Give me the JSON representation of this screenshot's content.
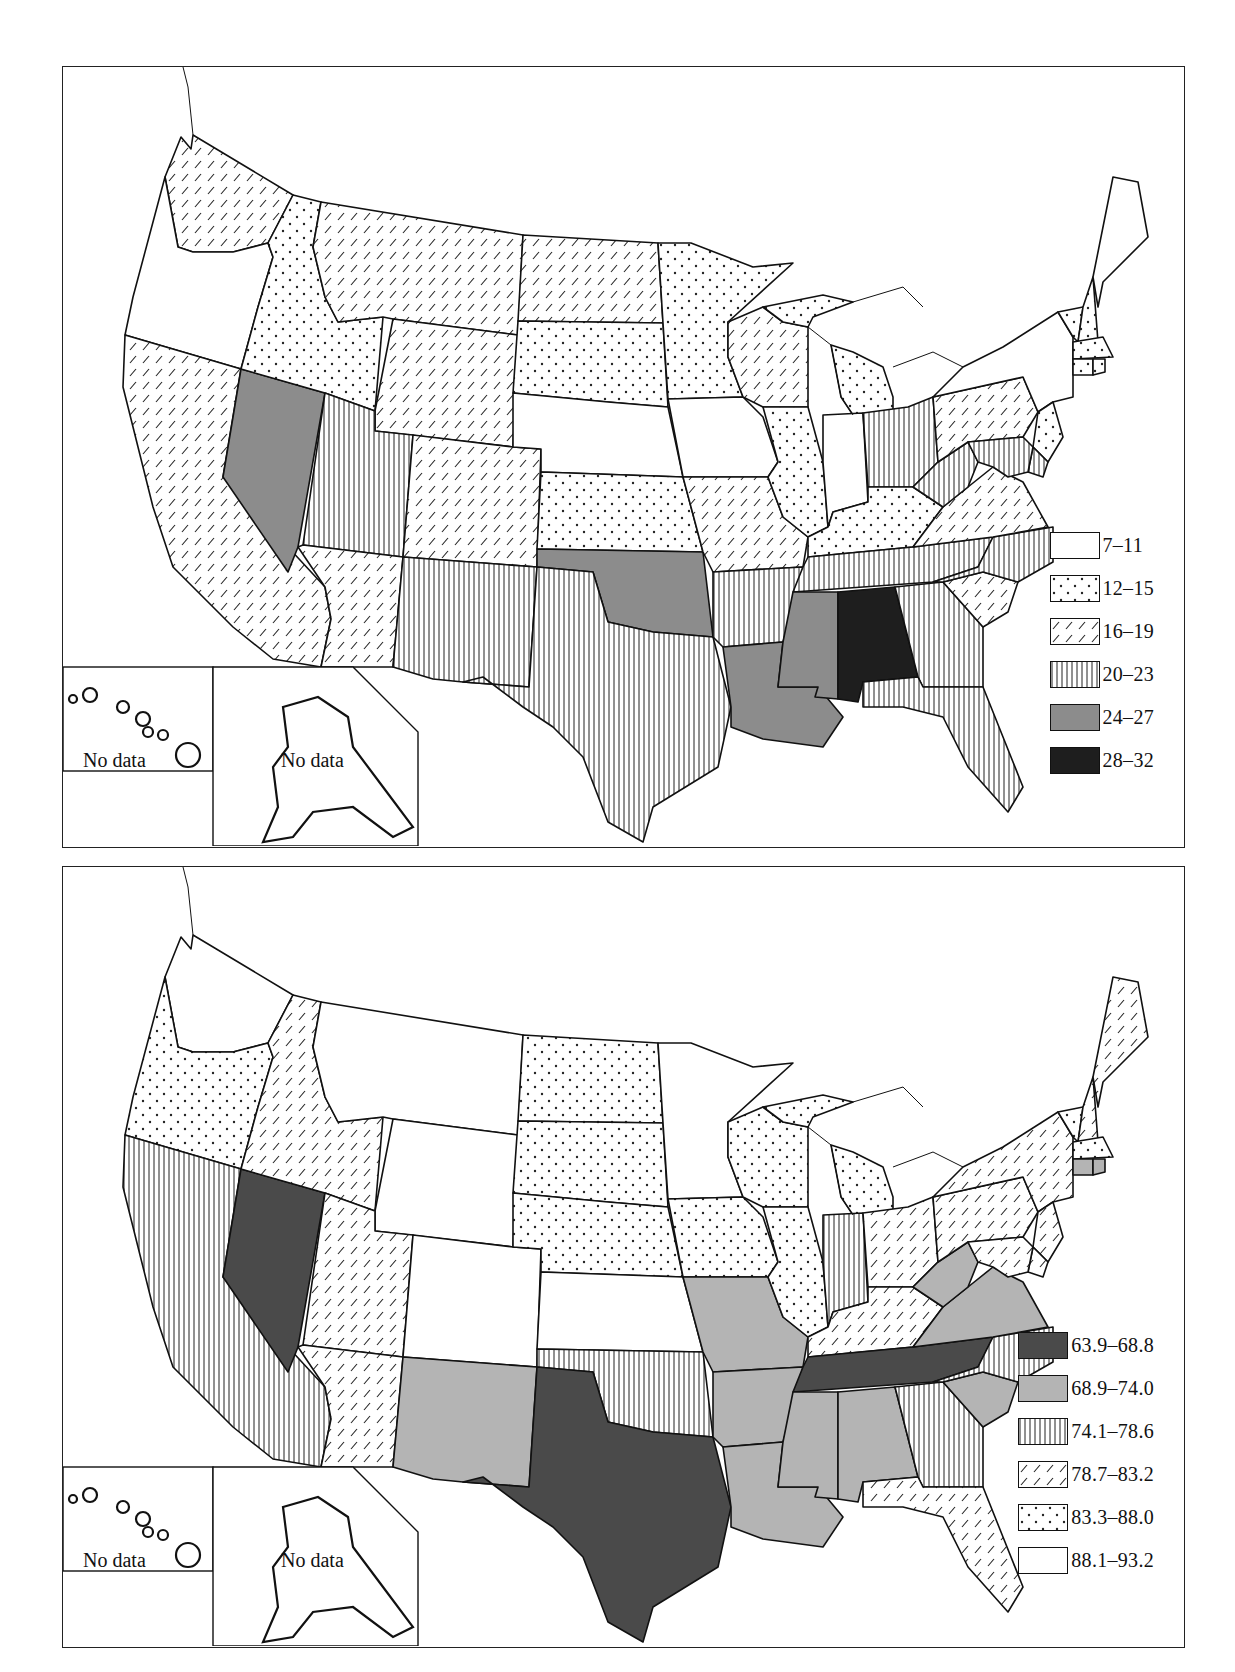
{
  "maps": [
    {
      "id": "map-1",
      "legend": [
        {
          "label": "7–11",
          "pattern": "white"
        },
        {
          "label": "12–15",
          "pattern": "dots"
        },
        {
          "label": "16–19",
          "pattern": "diag"
        },
        {
          "label": "20–23",
          "pattern": "vert"
        },
        {
          "label": "24–27",
          "pattern": "gray"
        },
        {
          "label": "28–32",
          "pattern": "black"
        }
      ],
      "insets": {
        "hawaii_label": "No data",
        "alaska_label": "No data"
      },
      "states": {
        "WA": "diag",
        "OR": "white",
        "CA": "diag",
        "NV": "gray",
        "ID": "dots",
        "MT": "diag",
        "WY": "diag",
        "UT": "vert",
        "AZ": "diag",
        "CO": "diag",
        "NM": "vert",
        "ND": "diag",
        "SD": "dots",
        "NE": "white",
        "KS": "dots",
        "OK": "gray",
        "TX": "vert",
        "MN": "dots",
        "IA": "white",
        "MO": "diag",
        "AR": "vert",
        "LA": "gray",
        "WI": "diag",
        "IL": "dots",
        "MI": "dots",
        "IN": "white",
        "OH": "vert",
        "KY": "dots",
        "TN": "vert",
        "MS": "gray",
        "AL": "black",
        "GA": "vert",
        "FL": "vert",
        "SC": "diag",
        "NC": "vert",
        "VA": "diag",
        "WV": "vert",
        "PA": "diag",
        "NY": "white",
        "VT": "dots",
        "NH": "dots",
        "ME": "white",
        "MA": "dots",
        "CT": "dots",
        "RI": "dots",
        "NJ": "dots",
        "DE": "vert",
        "MD": "vert"
      }
    },
    {
      "id": "map-2",
      "legend": [
        {
          "label": "63.9–68.8",
          "pattern": "dark"
        },
        {
          "label": "68.9–74.0",
          "pattern": "light"
        },
        {
          "label": "74.1–78.6",
          "pattern": "vert"
        },
        {
          "label": "78.7–83.2",
          "pattern": "diag"
        },
        {
          "label": "83.3–88.0",
          "pattern": "dots"
        },
        {
          "label": "88.1–93.2",
          "pattern": "white"
        }
      ],
      "insets": {
        "hawaii_label": "No data",
        "alaska_label": "No data"
      },
      "states": {
        "WA": "white",
        "OR": "dots",
        "CA": "vert",
        "NV": "dark",
        "ID": "diag",
        "MT": "white",
        "WY": "white",
        "UT": "diag",
        "AZ": "diag",
        "CO": "white",
        "NM": "light",
        "ND": "dots",
        "SD": "dots",
        "NE": "dots",
        "KS": "white",
        "OK": "vert",
        "TX": "dark",
        "MN": "white",
        "IA": "dots",
        "MO": "light",
        "AR": "light",
        "LA": "light",
        "WI": "dots",
        "IL": "dots",
        "MI": "dots",
        "IN": "vert",
        "OH": "diag",
        "KY": "diag",
        "TN": "dark",
        "MS": "light",
        "AL": "light",
        "GA": "vert",
        "FL": "diag",
        "SC": "light",
        "NC": "vert",
        "VA": "light",
        "WV": "light",
        "PA": "diag",
        "NY": "diag",
        "VT": "dots",
        "NH": "diag",
        "ME": "diag",
        "MA": "dots",
        "CT": "light",
        "RI": "light",
        "NJ": "diag",
        "DE": "diag",
        "MD": "diag"
      }
    }
  ],
  "colors": {
    "gray": "#8c8c8c",
    "black": "#1e1e1e",
    "dark": "#4a4a4a",
    "light": "#b4b4b4",
    "line": "#111111"
  }
}
